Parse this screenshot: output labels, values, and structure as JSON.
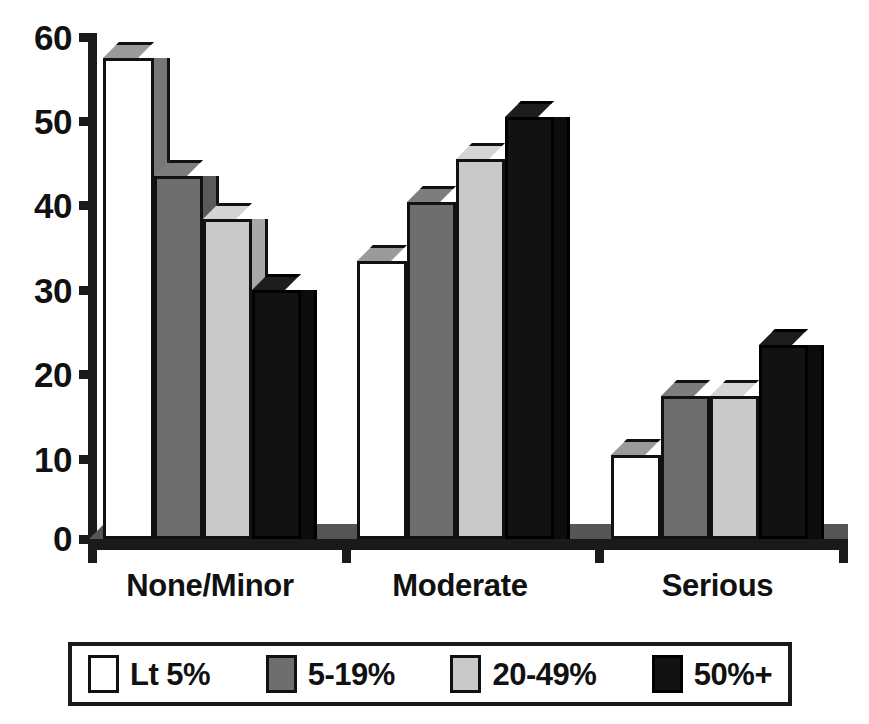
{
  "chart_data": {
    "type": "bar",
    "title": "",
    "subtitle": "",
    "xlabel": "",
    "ylabel": "",
    "categories": [
      "None/Minor",
      "Moderate",
      "Serious"
    ],
    "series": [
      {
        "name": "Lt  5%",
        "swatch": "white",
        "color": "#ffffff",
        "values": [
          57,
          33,
          10
        ]
      },
      {
        "name": "5-19%",
        "swatch": "dark",
        "color": "#6e6e6e",
        "values": [
          43,
          40,
          17
        ]
      },
      {
        "name": "20-49%",
        "swatch": "light",
        "color": "#c9c9c9",
        "values": [
          38,
          45,
          17
        ]
      },
      {
        "name": "50%+",
        "swatch": "black",
        "color": "#121212",
        "values": [
          29.5,
          50,
          23
        ]
      }
    ],
    "ylim": [
      0,
      60
    ],
    "yticks": [
      0,
      10,
      20,
      30,
      40,
      50,
      60
    ],
    "ytick_labels": [
      "0",
      "10",
      "20",
      "30",
      "40",
      "50",
      "60"
    ],
    "grid": false,
    "legend_position": "bottom",
    "style": "3d-extruded-bars"
  },
  "axis": {
    "y_tick_labels": [
      "60",
      "50",
      "40",
      "30",
      "20",
      "10",
      "0"
    ]
  },
  "legend": {
    "entries": [
      {
        "label": "Lt  5%"
      },
      {
        "label": "5-19%"
      },
      {
        "label": "20-49%"
      },
      {
        "label": "50%+"
      }
    ]
  }
}
